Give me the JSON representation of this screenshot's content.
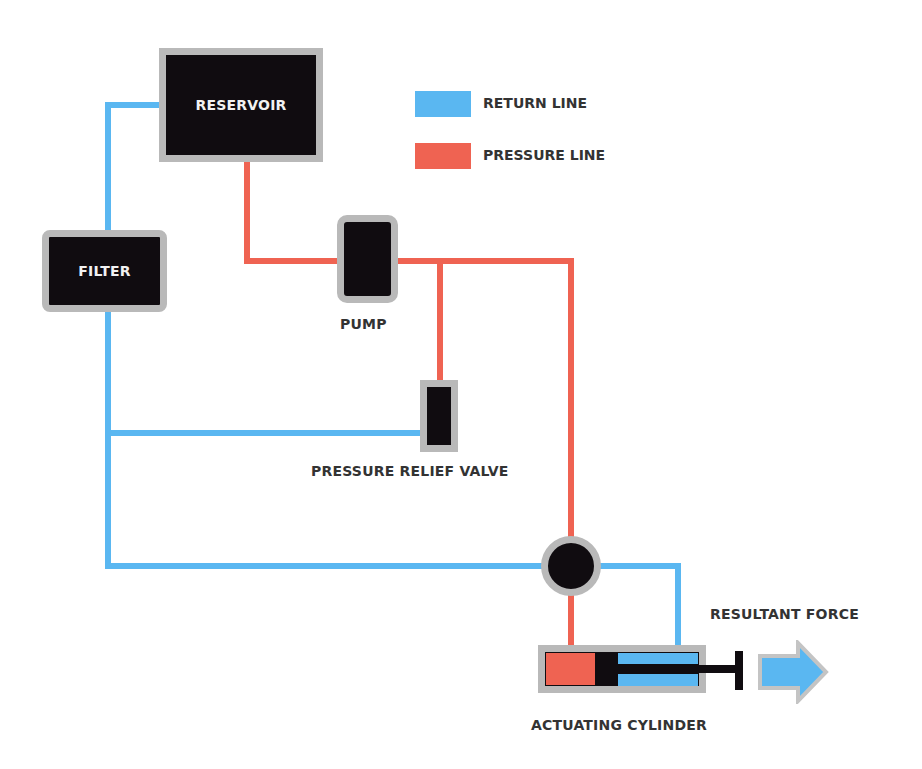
{
  "legend": {
    "items": [
      {
        "label": "RETURN LINE",
        "color": "#5ab7f1"
      },
      {
        "label": "PRESSURE LINE",
        "color": "#ef6352"
      }
    ]
  },
  "components": {
    "reservoir": {
      "label": "RESERVOIR"
    },
    "filter": {
      "label": "FILTER"
    },
    "pump": {
      "label": "PUMP"
    },
    "relief_valve": {
      "label": "PRESSURE RELIEF VALVE"
    },
    "control_valve": {
      "label": ""
    },
    "cylinder": {
      "label": "ACTUATING CYLINDER"
    },
    "force": {
      "label": "RESULTANT FORCE"
    }
  },
  "colors": {
    "return": "#5ab7f1",
    "pressure": "#ef6352",
    "component_fill": "#100c10",
    "component_border": "#b9b9b9",
    "text": "#333333"
  }
}
